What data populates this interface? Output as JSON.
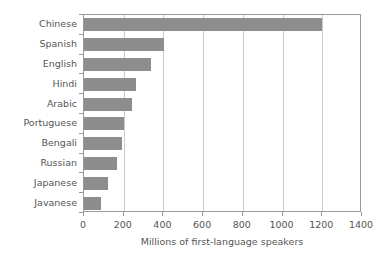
{
  "chart_data": {
    "type": "bar",
    "orientation": "horizontal",
    "title": "",
    "xlabel": "Millions of first-language speakers",
    "ylabel": "",
    "categories": [
      "Chinese",
      "Spanish",
      "English",
      "Hindi",
      "Arabic",
      "Portuguese",
      "Bengali",
      "Russian",
      "Japanese",
      "Javanese"
    ],
    "values": [
      1200,
      405,
      335,
      260,
      240,
      203,
      193,
      167,
      122,
      84
    ],
    "xlim": [
      0,
      1400
    ],
    "xticks": [
      0,
      200,
      400,
      600,
      800,
      1000,
      1200,
      1400
    ],
    "xtick_labels": [
      "0",
      "200",
      "400",
      "600",
      "800",
      "1000",
      "1200",
      "1400"
    ],
    "grid": "vertical",
    "legend": "none",
    "bar_color": "#8d8d8d",
    "grid_color": "#c9c9c9",
    "axis_color": "#9a9a9a",
    "text_color": "#555555",
    "background_color": "#ffffff"
  }
}
